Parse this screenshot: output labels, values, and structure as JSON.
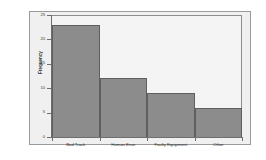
{
  "chart_data": {
    "type": "bar",
    "title": "",
    "xlabel": "",
    "ylabel": "Frequency",
    "categories": [
      "Bad Track",
      "Human Error",
      "Faulty Equipment",
      "Other"
    ],
    "values": [
      23,
      12,
      9,
      6
    ],
    "ylim": [
      0,
      25
    ],
    "yticks": [
      0,
      5,
      10,
      15,
      20,
      25
    ],
    "ytick_labels": [
      "0",
      "5",
      "10",
      "15",
      "20",
      "25"
    ],
    "grid": false,
    "legend": "none",
    "bar_gap": 0,
    "colors": {
      "bar_fill": "#8c8c8c",
      "bar_edge": "#5f5f5f",
      "plot_background": "#f4f4f4",
      "panel_background": "#f0f0f0",
      "figure_background": "#ffffff",
      "axis_line": "#6e6e6e",
      "text": "#2e2e2e"
    }
  }
}
